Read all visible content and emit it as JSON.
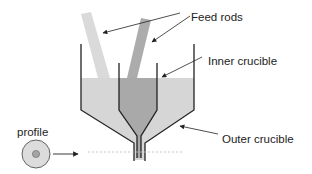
{
  "diagram": {
    "labels": {
      "feed_rods": "Feed rods",
      "inner_crucible": "Inner crucible",
      "outer_crucible": "Outer crucible",
      "profile": "profile"
    },
    "colors": {
      "outer_melt": "#d6d6d6",
      "inner_melt": "#a9a9a9",
      "light_rod": "#dadada",
      "dark_rod": "#acacac",
      "walls": "#222222",
      "profile_outer": "#dcdcdc",
      "profile_core": "#a4a4a4"
    }
  }
}
